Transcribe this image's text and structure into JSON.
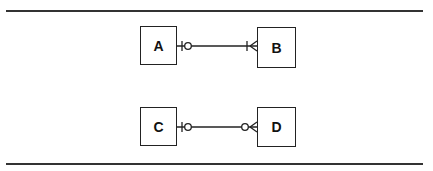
{
  "diagram": {
    "type": "entity-relationship",
    "notation": "crow's foot",
    "entities": [
      {
        "id": "A",
        "label": "A"
      },
      {
        "id": "B",
        "label": "B"
      },
      {
        "id": "C",
        "label": "C"
      },
      {
        "id": "D",
        "label": "D"
      }
    ],
    "relationships": [
      {
        "from": "A",
        "to": "B",
        "from_end": "zero-or-one",
        "to_end": "one-or-many"
      },
      {
        "from": "C",
        "to": "D",
        "from_end": "zero-or-one",
        "to_end": "zero-or-many"
      }
    ],
    "colors": {
      "line": "#222222",
      "background": "#ffffff"
    }
  }
}
